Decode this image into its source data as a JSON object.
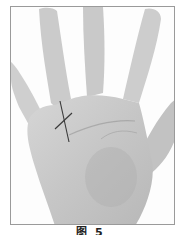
{
  "figure": {
    "caption": "图 5",
    "annotation": "cross-mark"
  },
  "colors": {
    "background": "#ffffff",
    "frame_border": "#9a9a9a",
    "skin_light": "#dcdcdc",
    "skin_mid": "#c4c4c4",
    "skin_shadow": "#a8a8a8",
    "mark": "#3a3a3a"
  }
}
